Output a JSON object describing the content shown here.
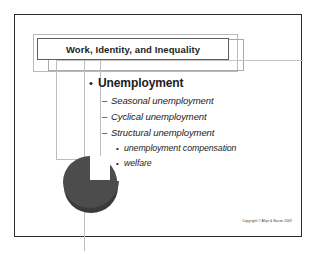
{
  "slide": {
    "title": "Work, Identity, and Inequality",
    "copyright": "Copyright © Allyn & Bacon 2009",
    "colors": {
      "frame_border": "#2b2b2b",
      "title_border": "#5e5e5e",
      "placeholder_outline": "#bdbdbd",
      "guide_line": "#bfbfbf",
      "pie_fill": "#4c4c4c",
      "pie_shadow": "#3a3a3a",
      "text": "#1d1d1d",
      "background": "#ffffff"
    },
    "bullets": [
      {
        "level": 1,
        "marker": "•",
        "text": "Unemployment"
      },
      {
        "level": 2,
        "marker": "–",
        "text": "Seasonal unemployment"
      },
      {
        "level": 2,
        "marker": "–",
        "text": "Cyclical unemployment"
      },
      {
        "level": 2,
        "marker": "–",
        "text": "Structural unemployment"
      },
      {
        "level": 3,
        "marker": "•",
        "text": "unemployment compensation"
      },
      {
        "level": 3,
        "marker": "•",
        "text": "welfare"
      }
    ],
    "graphic": {
      "name": "pie-chart-with-exploded-slice",
      "description": "dark gray pie chart with a quarter wedge separated at upper right"
    }
  }
}
